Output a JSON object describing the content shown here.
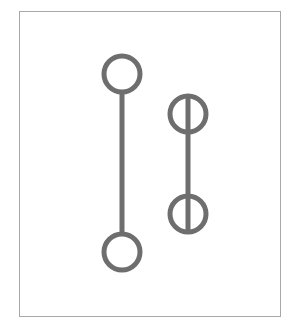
{
  "diagram": {
    "type": "dumbbell-symbols",
    "colors": {
      "stroke": "#6e6e6e",
      "frame": "#a8a8a8",
      "background": "#ffffff"
    },
    "stroke_width": 5,
    "frame": {
      "x": 19,
      "y": 11,
      "width": 262,
      "height": 306
    },
    "symbols": [
      {
        "name": "open-circles-connected",
        "line": {
          "x1": 122,
          "y1": 92,
          "x2": 122,
          "y2": 234
        },
        "circles": [
          {
            "cx": 122,
            "cy": 74,
            "r": 18
          },
          {
            "cx": 122,
            "cy": 252,
            "r": 18
          }
        ]
      },
      {
        "name": "bisected-circles-connected",
        "line": {
          "x1": 188,
          "y1": 96,
          "x2": 188,
          "y2": 232
        },
        "circles": [
          {
            "cx": 188,
            "cy": 114,
            "r": 18
          },
          {
            "cx": 188,
            "cy": 214,
            "r": 18
          }
        ]
      }
    ]
  }
}
